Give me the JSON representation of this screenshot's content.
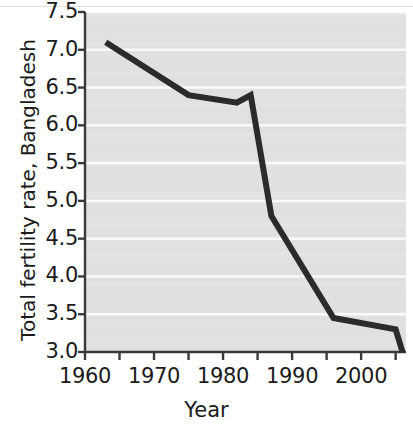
{
  "chart_data": {
    "type": "line",
    "title": "",
    "xlabel": "Year",
    "ylabel": "Total fertility rate, Bangladesh",
    "xlim": [
      1960,
      2006.5
    ],
    "ylim": [
      3.0,
      7.5
    ],
    "grid": "horizontal",
    "grid_color": "#ffffff",
    "plot_background": "#e0e0e0",
    "line_color": "#2b2b2b",
    "line_width": 6,
    "legend": "none",
    "xticks": [
      1960,
      1965,
      1970,
      1975,
      1980,
      1985,
      1990,
      1995,
      2000,
      2005
    ],
    "xtick_labels": [
      "1960",
      "",
      "1970",
      "",
      "1980",
      "",
      "1990",
      "",
      "2000",
      ""
    ],
    "xtick_major_labels": [
      {
        "value": 1960,
        "label": "1960"
      },
      {
        "value": 1970,
        "label": "1970"
      },
      {
        "value": 1980,
        "label": "1980"
      },
      {
        "value": 1990,
        "label": "1990"
      },
      {
        "value": 2000,
        "label": "2000"
      }
    ],
    "yticks": [
      3.0,
      3.5,
      4.0,
      4.5,
      5.0,
      5.5,
      6.0,
      6.5,
      7.0,
      7.5
    ],
    "ytick_labels": [
      "3.0",
      "3.5",
      "4.0",
      "4.5",
      "5.0",
      "5.5",
      "6.0",
      "6.5",
      "7.0",
      "7.5"
    ],
    "series": [
      {
        "name": "Total fertility rate, Bangladesh",
        "x": [
          1963,
          1975,
          1982,
          1984,
          1987,
          1996,
          2005,
          2006
        ],
        "values": [
          7.1,
          6.4,
          6.3,
          6.4,
          4.8,
          3.45,
          3.3,
          3.0
        ]
      }
    ],
    "points": [
      {
        "year": 1963,
        "value": 7.1
      },
      {
        "year": 1975,
        "value": 6.4
      },
      {
        "year": 1982,
        "value": 6.3
      },
      {
        "year": 1984,
        "value": 6.4
      },
      {
        "year": 1987,
        "value": 4.8
      },
      {
        "year": 1996,
        "value": 3.45
      },
      {
        "year": 2005,
        "value": 3.3
      },
      {
        "year": 2006,
        "value": 3.0
      }
    ]
  }
}
